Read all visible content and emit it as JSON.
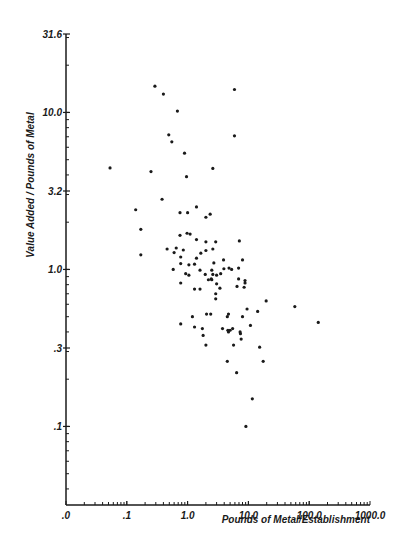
{
  "chart_data": {
    "type": "scatter",
    "title": "",
    "xlabel": "Pounds of Metal/Establishment",
    "ylabel": "Value Added / Pounds of Metal",
    "xscale": "log",
    "yscale": "log",
    "xlim": [
      0.01,
      1000
    ],
    "ylim": [
      0.0316,
      31.6
    ],
    "grid": false,
    "legend": null,
    "x_ticks": [
      {
        "value": 0.01,
        "label": ".0"
      },
      {
        "value": 0.1,
        "label": ".1"
      },
      {
        "value": 1,
        "label": "1.0"
      },
      {
        "value": 10,
        "label": "10.0"
      },
      {
        "value": 100,
        "label": "100.0"
      },
      {
        "value": 1000,
        "label": "1000.0"
      }
    ],
    "y_ticks": [
      {
        "value": 31.6,
        "label": "31.6"
      },
      {
        "value": 10,
        "label": "10.0"
      },
      {
        "value": 3.16,
        "label": "3.2"
      },
      {
        "value": 1,
        "label": "1.0"
      },
      {
        "value": 0.316,
        "label": ".3"
      },
      {
        "value": 0.1,
        "label": ".1"
      }
    ],
    "series": [
      {
        "name": "establishments",
        "points": [
          [
            0.053,
            4.43
          ],
          [
            0.29,
            14.7
          ],
          [
            0.4,
            13.1
          ],
          [
            0.68,
            10.2
          ],
          [
            0.49,
            7.2
          ],
          [
            0.55,
            6.5
          ],
          [
            0.89,
            5.5
          ],
          [
            5.9,
            14.0
          ],
          [
            5.9,
            7.1
          ],
          [
            2.6,
            4.4
          ],
          [
            0.25,
            4.2
          ],
          [
            0.96,
            3.9
          ],
          [
            0.38,
            2.8
          ],
          [
            0.14,
            2.4
          ],
          [
            0.75,
            2.3
          ],
          [
            1.0,
            2.3
          ],
          [
            1.4,
            2.5
          ],
          [
            0.17,
            1.8
          ],
          [
            0.75,
            1.65
          ],
          [
            0.98,
            1.7
          ],
          [
            1.1,
            1.68
          ],
          [
            1.4,
            1.55
          ],
          [
            0.46,
            1.35
          ],
          [
            0.65,
            1.37
          ],
          [
            0.6,
            1.28
          ],
          [
            0.85,
            1.33
          ],
          [
            0.17,
            1.24
          ],
          [
            0.77,
            1.2
          ],
          [
            0.77,
            1.09
          ],
          [
            1.05,
            1.07
          ],
          [
            1.4,
            1.18
          ],
          [
            0.58,
            1.0
          ],
          [
            0.93,
            0.94
          ],
          [
            1.05,
            0.92
          ],
          [
            2.0,
            2.15
          ],
          [
            2.35,
            2.25
          ],
          [
            2.0,
            1.5
          ],
          [
            2.9,
            1.5
          ],
          [
            2.6,
            1.35
          ],
          [
            7.1,
            1.52
          ],
          [
            1.65,
            1.27
          ],
          [
            2.0,
            1.32
          ],
          [
            1.3,
            1.08
          ],
          [
            2.7,
            1.1
          ],
          [
            3.9,
            1.15
          ],
          [
            8.0,
            1.15
          ],
          [
            1.6,
            0.99
          ],
          [
            2.5,
            0.99
          ],
          [
            3.95,
            1.01
          ],
          [
            4.8,
            1.02
          ],
          [
            5.3,
            1.0
          ],
          [
            6.9,
            1.02
          ],
          [
            2.6,
            0.93
          ],
          [
            3.5,
            0.94
          ],
          [
            6.9,
            0.87
          ],
          [
            1.95,
            0.93
          ],
          [
            2.45,
            0.87
          ],
          [
            3.0,
            0.92
          ],
          [
            2.2,
            0.86
          ],
          [
            2.5,
            0.86
          ],
          [
            3.0,
            0.81
          ],
          [
            0.77,
            0.82
          ],
          [
            1.3,
            0.75
          ],
          [
            1.6,
            0.75
          ],
          [
            6.5,
            0.78
          ],
          [
            3.4,
            0.76
          ],
          [
            2.9,
            0.7
          ],
          [
            2.9,
            0.65
          ],
          [
            8.8,
            0.85
          ],
          [
            8.8,
            0.82
          ],
          [
            8.5,
            0.77
          ],
          [
            1.2,
            0.5
          ],
          [
            2.05,
            0.52
          ],
          [
            2.4,
            0.52
          ],
          [
            4.5,
            0.5
          ],
          [
            4.7,
            0.52
          ],
          [
            8.0,
            0.5
          ],
          [
            9.5,
            0.56
          ],
          [
            14.2,
            0.54
          ],
          [
            0.77,
            0.45
          ],
          [
            1.3,
            0.43
          ],
          [
            1.75,
            0.42
          ],
          [
            3.75,
            0.42
          ],
          [
            4.6,
            0.41
          ],
          [
            4.7,
            0.4
          ],
          [
            5.0,
            0.41
          ],
          [
            5.5,
            0.42
          ],
          [
            7.3,
            0.4
          ],
          [
            7.4,
            0.39
          ],
          [
            7.6,
            0.36
          ],
          [
            10.8,
            0.44
          ],
          [
            1.8,
            0.38
          ],
          [
            2.0,
            0.33
          ],
          [
            5.7,
            0.33
          ],
          [
            15.3,
            0.32
          ],
          [
            4.5,
            0.26
          ],
          [
            17.5,
            0.26
          ],
          [
            6.4,
            0.22
          ],
          [
            11.6,
            0.15
          ],
          [
            9.1,
            0.1
          ],
          [
            19.6,
            0.63
          ],
          [
            58.0,
            0.58
          ],
          [
            141.0,
            0.46
          ]
        ]
      }
    ]
  }
}
